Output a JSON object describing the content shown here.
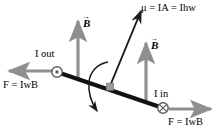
{
  "figure": {
    "colors": {
      "rod": "#121212",
      "field_arrow": "#8f8f8f",
      "force_arrow": "#8f8f8f",
      "moment_arrow": "#1a1a1a",
      "rotation_arrow": "#1a1a1a",
      "pivot": "#9a9a9a",
      "background": "#ffffff"
    }
  },
  "labels": {
    "moment": {
      "symbol": "μ",
      "text": "μ = IA = Ihw",
      "name": "magnetic-moment"
    },
    "field_left": {
      "text": "B",
      "name": "magnetic-field-left"
    },
    "field_right": {
      "text": "B",
      "name": "magnetic-field-right"
    },
    "current_out": {
      "text": "I out",
      "name": "current-out-of-page"
    },
    "current_in": {
      "text": "I in",
      "name": "current-into-page"
    },
    "force_left": {
      "text": "F = IwB",
      "name": "force-left"
    },
    "force_right": {
      "text": "F = IwB",
      "name": "force-right"
    }
  },
  "symbols": {
    "current_out_glyph": "circle-dot-icon",
    "current_in_glyph": "circle-cross-icon",
    "pivot_glyph": "pivot-square-icon",
    "rotation_glyph": "curved-rotation-arrow-icon"
  },
  "geometry": {
    "rod": {
      "x1": 57,
      "y1": 72,
      "x2": 163,
      "y2": 108
    },
    "moment_arrow": {
      "x1": 110,
      "y1": 86,
      "x2": 142,
      "y2": 9
    },
    "field_left_arrow": {
      "x1": 78,
      "y1": 78,
      "x2": 78,
      "y2": 20
    },
    "field_right_arrow": {
      "x1": 146,
      "y1": 100,
      "x2": 146,
      "y2": 42
    },
    "force_left_arrow": {
      "x1": 52,
      "y1": 71,
      "x2": 8,
      "y2": 71
    },
    "force_right_arrow": {
      "x1": 168,
      "y1": 109,
      "x2": 212,
      "y2": 109
    },
    "current_out_marker": {
      "cx": 57,
      "cy": 72,
      "r": 5
    },
    "current_in_marker": {
      "cx": 163,
      "cy": 108,
      "r": 5
    },
    "pivot_marker": {
      "cx": 110,
      "cy": 88,
      "size": 6
    }
  }
}
